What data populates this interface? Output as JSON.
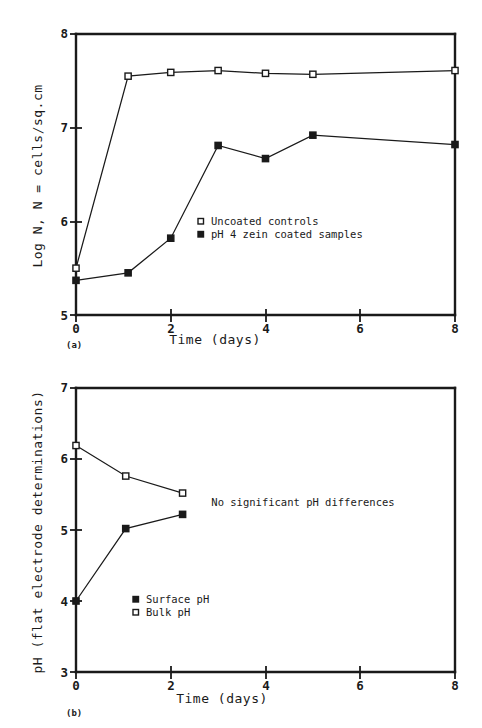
{
  "figure": {
    "panels": [
      {
        "id": "a",
        "panel_label": "(a)",
        "xlabel": "Time (days)",
        "ylabel": "Log N, N = cells/sq.cm",
        "xticks": [
          "0",
          "2",
          "4",
          "6",
          "8"
        ],
        "yticks": [
          "5",
          "6",
          "7",
          "8"
        ],
        "legend": [
          {
            "marker": "open-square",
            "label": "Uncoated controls"
          },
          {
            "marker": "filled-square",
            "label": "pH 4 zein coated samples"
          }
        ]
      },
      {
        "id": "b",
        "panel_label": "(b)",
        "xlabel": "Time (days)",
        "ylabel": "pH (flat electrode determinations)",
        "xticks": [
          "0",
          "2",
          "4",
          "6",
          "8"
        ],
        "yticks": [
          "3",
          "4",
          "5",
          "6",
          "7"
        ],
        "legend": [
          {
            "marker": "filled-square",
            "label": "Surface pH"
          },
          {
            "marker": "open-square",
            "label": "Bulk pH"
          }
        ],
        "annotation": "No significant pH differences"
      }
    ]
  },
  "chart_data": [
    {
      "type": "line",
      "panel": "a",
      "title": "",
      "xlabel": "Time (days)",
      "ylabel": "Log N, N = cells/sq.cm",
      "xlim": [
        0,
        8
      ],
      "ylim": [
        5,
        8
      ],
      "xticks": [
        0,
        2,
        4,
        6,
        8
      ],
      "yticks": [
        5,
        6,
        7,
        8
      ],
      "grid": false,
      "legend_position": "center-right",
      "series": [
        {
          "name": "Uncoated controls",
          "marker": "open-square",
          "x": [
            0,
            1.1,
            2,
            3,
            4,
            5,
            8
          ],
          "values": [
            5.5,
            7.55,
            7.59,
            7.61,
            7.58,
            7.57,
            7.61
          ]
        },
        {
          "name": "pH 4 zein coated samples",
          "marker": "filled-square",
          "x": [
            0,
            1.1,
            2,
            3,
            4,
            5,
            8
          ],
          "values": [
            5.37,
            5.45,
            5.82,
            6.81,
            6.67,
            6.92,
            6.82
          ]
        }
      ]
    },
    {
      "type": "line",
      "panel": "b",
      "title": "",
      "xlabel": "Time (days)",
      "ylabel": "pH (flat electrode determinations)",
      "xlim": [
        0,
        8
      ],
      "ylim": [
        3,
        7
      ],
      "xticks": [
        0,
        2,
        4,
        6,
        8
      ],
      "yticks": [
        3,
        4,
        5,
        6,
        7
      ],
      "grid": false,
      "legend_position": "lower-left",
      "annotations": [
        {
          "text": "No significant pH differences",
          "x": 3.95,
          "y": 5.37
        }
      ],
      "series": [
        {
          "name": "Bulk pH",
          "marker": "open-square",
          "x": [
            0,
            1.05,
            2.25
          ],
          "values": [
            6.19,
            5.76,
            5.52
          ]
        },
        {
          "name": "Surface pH",
          "marker": "filled-square",
          "x": [
            0,
            1.05,
            2.25
          ],
          "values": [
            4.0,
            5.02,
            5.22
          ]
        }
      ]
    }
  ]
}
